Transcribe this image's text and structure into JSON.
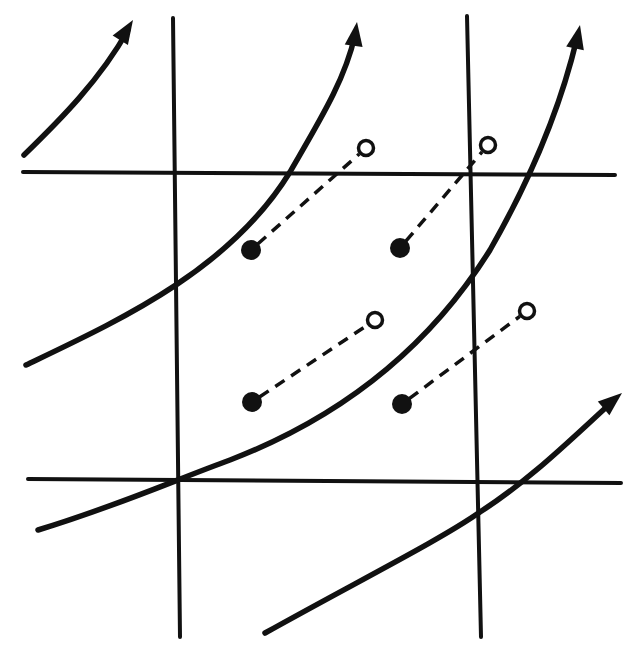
{
  "diagram": {
    "colors": {
      "ink": "#111111",
      "background": "#ffffff"
    },
    "grid": {
      "vertical_lines": [
        {
          "x1": 173,
          "y1": 18,
          "x2": 180,
          "y2": 637
        },
        {
          "x1": 467,
          "y1": 16,
          "x2": 481,
          "y2": 637
        }
      ],
      "horizontal_lines": [
        {
          "x1": 23,
          "y1": 172,
          "x2": 615,
          "y2": 175
        },
        {
          "x1": 28,
          "y1": 479,
          "x2": 621,
          "y2": 483
        }
      ]
    },
    "streamlines": [
      {
        "name": "streamline-1",
        "path": "M24,155 C60,120 100,80 128,30",
        "arrow_tip": [
          133,
          20
        ],
        "arrow_angle": -58
      },
      {
        "name": "streamline-2",
        "path": "M26,365 C120,320 230,270 290,172 C320,120 345,80 355,35",
        "arrow_tip": [
          357,
          22
        ],
        "arrow_angle": -82
      },
      {
        "name": "streamline-3",
        "path": "M38,530 C120,505 175,480 230,460 C360,410 440,330 490,250 C530,180 560,110 577,38",
        "arrow_tip": [
          580,
          25
        ],
        "arrow_angle": -78
      },
      {
        "name": "streamline-4",
        "path": "M265,633 C360,580 440,540 480,512 C530,480 570,440 612,402",
        "arrow_tip": [
          622,
          393
        ],
        "arrow_angle": -40
      }
    ],
    "trajectories": [
      {
        "name": "trajectory-1",
        "start": [
          251,
          250
        ],
        "end": [
          366,
          148
        ]
      },
      {
        "name": "trajectory-2",
        "start": [
          400,
          248
        ],
        "end": [
          488,
          145
        ]
      },
      {
        "name": "trajectory-3",
        "start": [
          252,
          402
        ],
        "end": [
          375,
          320
        ]
      },
      {
        "name": "trajectory-4",
        "start": [
          402,
          404
        ],
        "end": [
          527,
          311
        ]
      }
    ],
    "legend": {
      "filled_dot": "initial particle position",
      "open_circle": "displaced particle position",
      "dashed_line": "particle path",
      "solid_arrow": "streamline"
    }
  }
}
